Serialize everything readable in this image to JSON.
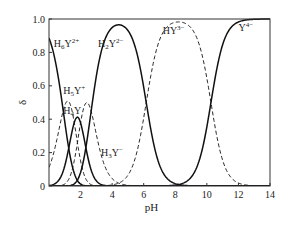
{
  "chart_data": {
    "type": "line",
    "title": "",
    "xlabel": "pH",
    "ylabel": "δ",
    "xlim": [
      0,
      14
    ],
    "ylim": [
      0,
      1.0
    ],
    "xticks": [
      2,
      4,
      6,
      8,
      10,
      12,
      14
    ],
    "xtick_labels": [
      "2",
      "4",
      "6",
      "8",
      "10",
      "12",
      "14"
    ],
    "yticks": [
      0,
      0.2,
      0.4,
      0.6,
      0.8,
      1.0
    ],
    "ytick_labels": [
      "0",
      "0.2",
      "0.4",
      "0.6",
      "0.8",
      "1.0"
    ],
    "grid": false,
    "legend": "inline labels",
    "pKa": [
      0.9,
      1.6,
      2.0,
      2.67,
      6.16,
      10.26
    ],
    "x": [
      0,
      1,
      2,
      3,
      4,
      5,
      6,
      7,
      8,
      9,
      10,
      11,
      12,
      13,
      14
    ],
    "series": [
      {
        "name": "H6Y2+",
        "label_main": "H",
        "sub": "6",
        "sup": "2+",
        "style": "solid",
        "values": [
          0.89,
          0.36,
          0.02,
          0.0,
          0.0,
          0.0,
          0.0,
          0.0,
          0.0,
          0.0,
          0.0,
          0.0,
          0.0,
          0.0,
          0.0
        ]
      },
      {
        "name": "H5Y+",
        "label_main": "H",
        "sub": "5",
        "sup": "+",
        "style": "dashed",
        "values": [
          0.11,
          0.45,
          0.15,
          0.01,
          0.0,
          0.0,
          0.0,
          0.0,
          0.0,
          0.0,
          0.0,
          0.0,
          0.0,
          0.0,
          0.0
        ]
      },
      {
        "name": "H4Y",
        "label_main": "H",
        "sub": "4",
        "sup": "",
        "style": "solid",
        "values": [
          0.0,
          0.11,
          0.38,
          0.11,
          0.01,
          0.0,
          0.0,
          0.0,
          0.0,
          0.0,
          0.0,
          0.0,
          0.0,
          0.0,
          0.0
        ]
      },
      {
        "name": "H3Y-",
        "label_main": "H",
        "sub": "3",
        "sup": "−",
        "style": "dashed",
        "values": [
          0.0,
          0.01,
          0.38,
          0.35,
          0.04,
          0.0,
          0.0,
          0.0,
          0.0,
          0.0,
          0.0,
          0.0,
          0.0,
          0.0,
          0.0
        ]
      },
      {
        "name": "H2Y2-",
        "label_main": "H",
        "sub": "2",
        "sup": "2−",
        "style": "solid",
        "values": [
          0.0,
          0.0,
          0.08,
          0.53,
          0.94,
          0.93,
          0.59,
          0.13,
          0.01,
          0.0,
          0.0,
          0.0,
          0.0,
          0.0,
          0.0
        ]
      },
      {
        "name": "HY3-",
        "label_main": "HY",
        "sub": "",
        "sup": "3−",
        "style": "dashed",
        "values": [
          0.0,
          0.0,
          0.0,
          0.0,
          0.0,
          0.07,
          0.41,
          0.87,
          0.98,
          0.95,
          0.65,
          0.15,
          0.02,
          0.0,
          0.0
        ]
      },
      {
        "name": "Y4-",
        "label_main": "Y",
        "sub": "",
        "sup": "4−",
        "style": "solid",
        "values": [
          0.0,
          0.0,
          0.0,
          0.0,
          0.0,
          0.0,
          0.0,
          0.0,
          0.01,
          0.05,
          0.35,
          0.85,
          0.98,
          1.0,
          1.0
        ]
      }
    ],
    "annotations": [
      {
        "series": "H6Y2+",
        "x": 0.3,
        "y": 0.83
      },
      {
        "series": "H5Y+",
        "x": 0.9,
        "y": 0.55
      },
      {
        "series": "H4Y",
        "x": 0.9,
        "y": 0.43
      },
      {
        "series": "H3Y-",
        "x": 3.3,
        "y": 0.18
      },
      {
        "series": "H2Y2-",
        "x": 3.1,
        "y": 0.83
      },
      {
        "series": "HY3-",
        "x": 7.2,
        "y": 0.91
      },
      {
        "series": "Y4-",
        "x": 12.0,
        "y": 0.93
      }
    ]
  }
}
